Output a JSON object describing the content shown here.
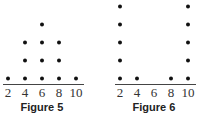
{
  "chart_data": [
    {
      "type": "dot",
      "title": "Figure 5",
      "categories": [
        "2",
        "4",
        "6",
        "8",
        "10"
      ],
      "values": [
        1,
        3,
        4,
        3,
        1
      ],
      "xlabel": "",
      "ylabel": ""
    },
    {
      "type": "dot",
      "title": "Figure 6",
      "categories": [
        "2",
        "4",
        "6",
        "8",
        "10"
      ],
      "values": [
        5,
        1,
        0,
        1,
        5
      ],
      "xlabel": "",
      "ylabel": ""
    }
  ]
}
